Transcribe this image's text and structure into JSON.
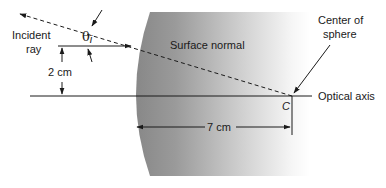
{
  "figure": {
    "type": "ray diagram"
  },
  "labels": {
    "incident_ray_line1": "Incident",
    "incident_ray_line2": "ray",
    "theta": "θ",
    "theta_sub": "i",
    "surface_normal": "Surface normal",
    "center_line1": "Center of",
    "center_line2": "sphere",
    "optical_axis": "Optical axis",
    "center_point": "C",
    "height_dim": "2 cm",
    "radius_dim": "7 cm"
  },
  "colors": {
    "sphere_dark": "#888888",
    "sphere_light": "#ffffff",
    "line": "#1a1a1a"
  }
}
